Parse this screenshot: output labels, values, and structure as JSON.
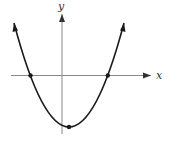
{
  "figure": {
    "x_axis_label": "x",
    "y_axis_label": "y",
    "colors": {
      "curve": "#1a1a1a",
      "axes": "#8a8a8a",
      "background": "#ffffff"
    },
    "marked_points": [
      {
        "name": "left-x-intercept",
        "px": [
          30.5,
          75.5
        ]
      },
      {
        "name": "right-x-intercept",
        "px": [
          107.8,
          75.5
        ]
      },
      {
        "name": "vertex",
        "px": [
          69,
          127
        ]
      }
    ]
  }
}
